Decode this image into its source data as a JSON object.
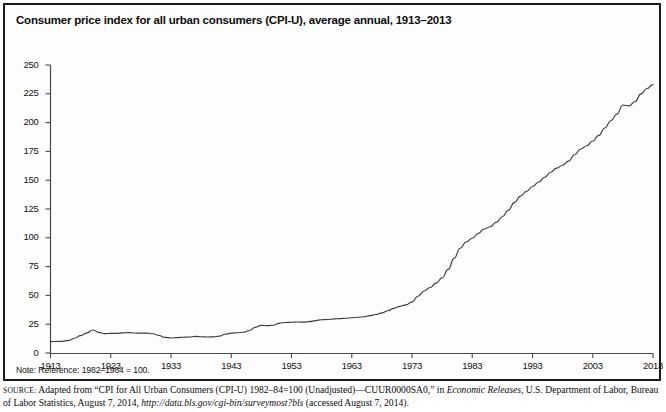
{
  "figure": {
    "title": "Consumer price index for all urban consumers (CPI-U), average annual, 1913–2013",
    "note": "Note: Reference: 1982–1984 = 100.",
    "source": {
      "label": "source:",
      "text_1": " Adapted from “CPI for All Urban Consumers (CPI-U) 1982–84=100 (Unadjusted)—CUUR0000SA0,” in ",
      "italic_1": "Economic Releases",
      "text_2": ", U.S. Department of Labor, Bureau of Labor Statistics, August 7, 2014, ",
      "italic_2": "http://data.bls.gov/cgi-bin/surveymost?bls",
      "text_3": " (accessed August 7, 2014)."
    },
    "colors": {
      "line": "#3d3d3d",
      "axis": "#4a4a4a",
      "frame": "#1b1b1b",
      "background": "#fdfdfd",
      "text": "#0d0d0d"
    }
  },
  "chart_data": {
    "type": "line",
    "title": "Consumer price index for all urban consumers (CPI-U), average annual, 1913–2013",
    "xlabel": "",
    "ylabel": "",
    "xlim": [
      1913,
      2013
    ],
    "ylim": [
      0,
      250
    ],
    "grid": false,
    "legend": false,
    "ytick_labels": [
      "0",
      "25",
      "50",
      "75",
      "100",
      "125",
      "150",
      "175",
      "200",
      "225",
      "250"
    ],
    "ytick_values": [
      0,
      25,
      50,
      75,
      100,
      125,
      150,
      175,
      200,
      225,
      250
    ],
    "xtick_labels": [
      "1913",
      "1923",
      "1933",
      "1943",
      "1953",
      "1963",
      "1973",
      "1983",
      "1993",
      "2003",
      "2013"
    ],
    "xtick_values": [
      1913,
      1923,
      1933,
      1943,
      1953,
      1963,
      1973,
      1983,
      1993,
      2003,
      2013
    ],
    "series": [
      {
        "name": "CPI-U (1982–1984 = 100)",
        "x": [
          1913,
          1914,
          1915,
          1916,
          1917,
          1918,
          1919,
          1920,
          1921,
          1922,
          1923,
          1924,
          1925,
          1926,
          1927,
          1928,
          1929,
          1930,
          1931,
          1932,
          1933,
          1934,
          1935,
          1936,
          1937,
          1938,
          1939,
          1940,
          1941,
          1942,
          1943,
          1944,
          1945,
          1946,
          1947,
          1948,
          1949,
          1950,
          1951,
          1952,
          1953,
          1954,
          1955,
          1956,
          1957,
          1958,
          1959,
          1960,
          1961,
          1962,
          1963,
          1964,
          1965,
          1966,
          1967,
          1968,
          1969,
          1970,
          1971,
          1972,
          1973,
          1974,
          1975,
          1976,
          1977,
          1978,
          1979,
          1980,
          1981,
          1982,
          1983,
          1984,
          1985,
          1986,
          1987,
          1988,
          1989,
          1990,
          1991,
          1992,
          1993,
          1994,
          1995,
          1996,
          1997,
          1998,
          1999,
          2000,
          2001,
          2002,
          2003,
          2004,
          2005,
          2006,
          2007,
          2008,
          2009,
          2010,
          2011,
          2012,
          2013
        ],
        "values": [
          9.9,
          10.0,
          10.1,
          10.9,
          12.8,
          15.1,
          17.3,
          20.0,
          17.9,
          16.8,
          17.1,
          17.1,
          17.5,
          17.7,
          17.4,
          17.2,
          17.2,
          16.7,
          15.2,
          13.6,
          13.0,
          13.4,
          13.7,
          13.9,
          14.4,
          14.1,
          13.9,
          14.0,
          14.7,
          16.3,
          17.3,
          17.6,
          18.0,
          19.5,
          22.3,
          24.0,
          23.8,
          24.1,
          26.0,
          26.5,
          26.7,
          26.9,
          26.8,
          27.2,
          28.1,
          28.9,
          29.1,
          29.6,
          29.9,
          30.2,
          30.6,
          31.0,
          31.5,
          32.4,
          33.4,
          34.8,
          36.7,
          38.8,
          40.5,
          41.8,
          44.4,
          49.3,
          53.8,
          56.9,
          60.6,
          65.2,
          72.6,
          82.4,
          90.9,
          96.5,
          99.6,
          103.9,
          107.6,
          109.6,
          113.6,
          118.3,
          124.0,
          130.7,
          136.2,
          140.3,
          144.5,
          148.2,
          152.4,
          156.9,
          160.5,
          163.0,
          166.6,
          172.2,
          177.1,
          179.9,
          184.0,
          188.9,
          195.3,
          201.6,
          207.3,
          215.3,
          214.5,
          218.1,
          224.9,
          229.6,
          233.0
        ]
      }
    ]
  }
}
